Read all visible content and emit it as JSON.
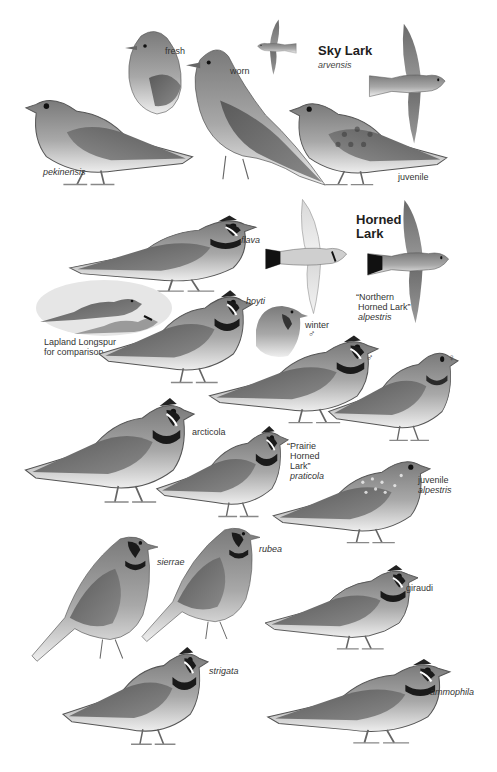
{
  "sky_lark": {
    "title": "Sky Lark",
    "subspecies": "arvensis",
    "labels": {
      "fresh": "fresh",
      "worn": "worn",
      "pekinensis": "pekinensis",
      "juvenile": "juvenile"
    }
  },
  "horned_lark": {
    "title_line1": "Horned",
    "title_line2": "Lark",
    "northern": {
      "line1": "“Northern",
      "line2": "Horned Lark”",
      "subspecies": "alpestris"
    },
    "prairie": {
      "line1": "“Prairie",
      "line2": "Horned",
      "line3": "Lark”",
      "subspecies": "praticola"
    },
    "labels": {
      "flava": "flava",
      "hoyti": "hoyti",
      "winter": "winter",
      "winter_sex": "♂",
      "male": "♂",
      "female": "♀",
      "arcticola": "arcticola",
      "juvenile": "juvenile",
      "juvenile_subspecies": "alpestris",
      "sierrae": "sierrae",
      "rubea": "rubea",
      "giraudi": "giraudi",
      "strigata": "strigata",
      "ammophila": "ammophila"
    }
  },
  "comparison": {
    "line1": "Lapland Longspur",
    "line2": "for comparison"
  },
  "colors": {
    "background": "#ffffff",
    "ink_dark": "#2b2b2b",
    "ink_mid": "#6e6e6e",
    "ink_light": "#bdbdbd"
  }
}
